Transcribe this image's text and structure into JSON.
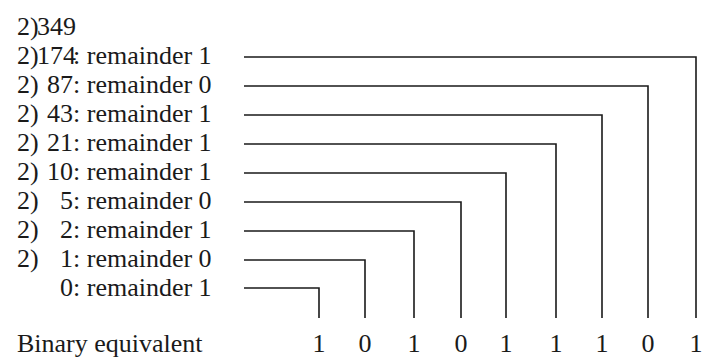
{
  "dividend": {
    "divisor": "2)",
    "value": "349"
  },
  "steps": [
    {
      "divisor": "2)",
      "quotient": "174",
      "remainder_text": ": remainder 1",
      "remainder": 1,
      "line_y": 57,
      "line_x_end": 696
    },
    {
      "divisor": "2)",
      "quotient": "87",
      "remainder_text": ": remainder 0",
      "remainder": 0,
      "line_y": 86,
      "line_x_end": 648
    },
    {
      "divisor": "2)",
      "quotient": "43",
      "remainder_text": ": remainder 1",
      "remainder": 1,
      "line_y": 115,
      "line_x_end": 602
    },
    {
      "divisor": "2)",
      "quotient": "21",
      "remainder_text": ": remainder 1",
      "remainder": 1,
      "line_y": 144,
      "line_x_end": 556
    },
    {
      "divisor": "2)",
      "quotient": "10",
      "remainder_text": ": remainder 1",
      "remainder": 1,
      "line_y": 173,
      "line_x_end": 506
    },
    {
      "divisor": "2)",
      "quotient": "5",
      "remainder_text": ": remainder 0",
      "remainder": 0,
      "line_y": 202,
      "line_x_end": 461
    },
    {
      "divisor": "2)",
      "quotient": "2",
      "remainder_text": ": remainder 1",
      "remainder": 1,
      "line_y": 231,
      "line_x_end": 414
    },
    {
      "divisor": "2)",
      "quotient": "1",
      "remainder_text": ": remainder 0",
      "remainder": 0,
      "line_y": 260,
      "line_x_end": 365
    },
    {
      "divisor": "",
      "quotient": "0",
      "remainder_text": ": remainder 1",
      "remainder": 1,
      "line_y": 288,
      "line_x_end": 319
    }
  ],
  "connector": {
    "line_x_start": 244,
    "vertical_y_end": 318,
    "stroke": "#1a1a1a",
    "stroke_width": 1.6
  },
  "binary": {
    "label": "Binary equivalent",
    "digits": [
      "1",
      "0",
      "1",
      "0",
      "1",
      "1",
      "1",
      "0",
      "1"
    ],
    "digit_x": [
      319,
      365,
      414,
      461,
      506,
      556,
      602,
      648,
      696
    ]
  }
}
